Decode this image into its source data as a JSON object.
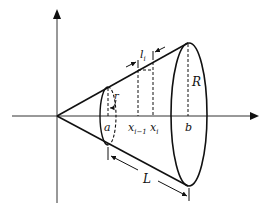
{
  "diagram": {
    "colors": {
      "stroke": "#111111",
      "axis": "#333333",
      "background": "#ffffff"
    },
    "labels": {
      "a": "a",
      "x_prev_base": "x",
      "x_prev_sub": "i−1",
      "x_i_base": "x",
      "x_i_sub": "i",
      "b": "b",
      "R": "R",
      "r": "r",
      "l_base": "l",
      "l_sub": "i",
      "L": "L"
    },
    "axes": [
      {
        "name": "x-axis",
        "direction": "horizontal",
        "arrow": "right"
      },
      {
        "name": "y-axis",
        "direction": "vertical",
        "arrow": "up"
      }
    ]
  }
}
